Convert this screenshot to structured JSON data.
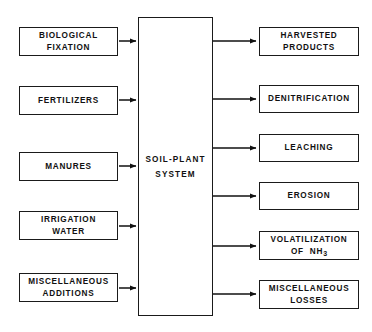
{
  "diagram": {
    "center": {
      "label_line1": "SOIL-PLANT",
      "label_line2": "SYSTEM",
      "border_color": "#1a1a1a",
      "fill_color": "#ffffff"
    },
    "inputs": [
      {
        "id": "biological-fixation",
        "line1": "BIOLOGICAL",
        "line2": "FIXATION"
      },
      {
        "id": "fertilizers",
        "line1": "FERTILIZERS",
        "line2": ""
      },
      {
        "id": "manures",
        "line1": "MANURES",
        "line2": ""
      },
      {
        "id": "irrigation-water",
        "line1": "IRRIGATION",
        "line2": "WATER"
      },
      {
        "id": "miscellaneous-additions",
        "line1": "MISCELLANEOUS",
        "line2": "ADDITIONS"
      }
    ],
    "outputs": [
      {
        "id": "harvested-products",
        "line1": "HARVESTED",
        "line2": "PRODUCTS"
      },
      {
        "id": "denitrification",
        "line1": "DENITRIFICATION",
        "line2": ""
      },
      {
        "id": "leaching",
        "line1": "LEACHING",
        "line2": ""
      },
      {
        "id": "erosion",
        "line1": "EROSION",
        "line2": ""
      },
      {
        "id": "volatilization-of-nh3",
        "line1": "VOLATILIZATION",
        "line2": "OF NH3",
        "line2_html": true
      },
      {
        "id": "miscellaneous-losses",
        "line1": "MISCELLANEOUS",
        "line2": "LOSSES"
      }
    ],
    "arrows": {
      "color": "#111111",
      "direction": "left-to-right",
      "input_arrow_count": 5,
      "output_arrow_count": 6
    }
  }
}
